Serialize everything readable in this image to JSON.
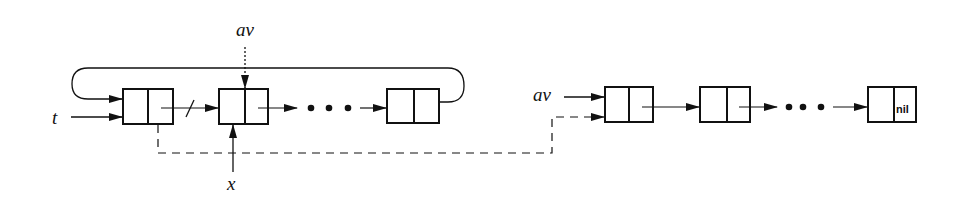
{
  "diagram": {
    "type": "linked-list-storage-diagram",
    "labels": {
      "t": "t",
      "av_top": "av",
      "x": "x",
      "av_right": "av",
      "nil": "nil"
    },
    "left_list": {
      "description": "circular list pointed to by t; first node's link is cut and redirected",
      "nodes": 4,
      "ellipsis": "• • •"
    },
    "right_list": {
      "description": "available-space list pointed to by av, terminated by nil",
      "nodes": 3,
      "ellipsis": "• • •"
    },
    "colors": {
      "ink": "#111111",
      "background": "#ffffff"
    }
  }
}
